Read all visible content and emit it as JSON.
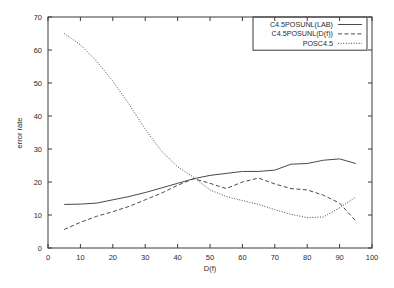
{
  "chart_data": {
    "type": "line",
    "title": "",
    "xlabel": "D(f)",
    "ylabel": "error rate",
    "xlim": [
      0,
      100
    ],
    "ylim": [
      0,
      70
    ],
    "xticks": [
      0,
      10,
      20,
      30,
      40,
      50,
      60,
      70,
      80,
      90,
      100
    ],
    "yticks": [
      0,
      10,
      20,
      30,
      40,
      50,
      60,
      70
    ],
    "grid": false,
    "legend_position": "top-right",
    "series": [
      {
        "name": "C4.5POSUNL(LAB)",
        "style": "solid",
        "x": [
          5,
          10,
          15,
          20,
          25,
          30,
          35,
          40,
          45,
          50,
          55,
          60,
          65,
          70,
          75,
          80,
          85,
          90,
          95
        ],
        "values": [
          13.2,
          13.3,
          13.6,
          14.6,
          15.6,
          16.8,
          18.2,
          19.6,
          21.0,
          22.0,
          22.6,
          23.2,
          23.2,
          23.6,
          25.4,
          25.6,
          26.6,
          27.0,
          25.6
        ]
      },
      {
        "name": "C4.5POSUNL(D(f))",
        "style": "dashed",
        "x": [
          5,
          10,
          15,
          20,
          25,
          30,
          35,
          40,
          45,
          50,
          55,
          60,
          65,
          70,
          75,
          80,
          85,
          90,
          95
        ],
        "values": [
          5.6,
          7.8,
          9.6,
          11.0,
          12.6,
          14.6,
          16.6,
          19.0,
          21.0,
          19.6,
          18.0,
          20.0,
          21.2,
          19.4,
          18.0,
          17.6,
          16.0,
          13.6,
          8.2
        ]
      },
      {
        "name": "POSC4.5",
        "style": "dotted",
        "x": [
          5,
          10,
          15,
          20,
          25,
          30,
          35,
          40,
          45,
          50,
          55,
          60,
          65,
          70,
          75,
          80,
          85,
          90,
          95
        ],
        "values": [
          65.0,
          61.6,
          56.6,
          50.6,
          43.6,
          36.0,
          29.4,
          24.6,
          21.4,
          17.6,
          15.6,
          14.4,
          13.2,
          11.6,
          10.2,
          9.2,
          9.4,
          12.2,
          15.4
        ]
      }
    ]
  },
  "legend": {
    "entries": [
      {
        "label": "C4.5POSUNL(LAB)"
      },
      {
        "label": "C4.5POSUNL(D(f))"
      },
      {
        "label": "POSC4.5"
      }
    ]
  }
}
